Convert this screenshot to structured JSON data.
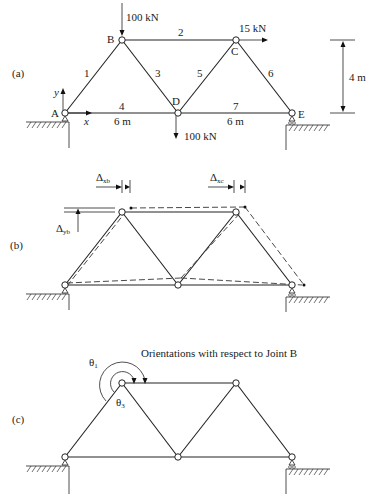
{
  "figure": {
    "panels": [
      {
        "id": "a",
        "label": "(a)",
        "joints": {
          "A": "A",
          "B": "B",
          "C": "C",
          "D": "D",
          "E": "E"
        },
        "members": {
          "m1": "1",
          "m2": "2",
          "m3": "3",
          "m4": "4",
          "m5": "5",
          "m6": "6",
          "m7": "7"
        },
        "loads": {
          "at_B": "100 kN",
          "at_C": "15 kN",
          "at_D": "100 kN"
        },
        "axes": {
          "x": "x",
          "y": "y"
        },
        "dimensions": {
          "span_AD": "6 m",
          "span_DE": "6 m",
          "height": "4 m"
        }
      },
      {
        "id": "b",
        "label": "(b)",
        "annotations": {
          "delta_xb": "Δ",
          "delta_xb_sub": "xb",
          "delta_yb": "Δ",
          "delta_yb_sub": "yb",
          "delta_xc": "Δ",
          "delta_xc_sub": "xc"
        }
      },
      {
        "id": "c",
        "label": "(c)",
        "caption": "Orientations with respect to Joint B",
        "angles": {
          "theta1": "θ",
          "theta1_sub": "1",
          "theta3": "θ",
          "theta3_sub": "3"
        }
      }
    ]
  }
}
